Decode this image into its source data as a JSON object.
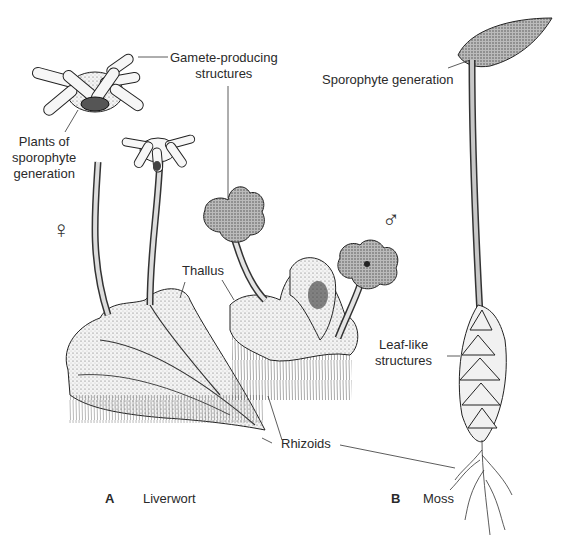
{
  "figure": {
    "panels": [
      {
        "letter": "A",
        "name": "Liverwort"
      },
      {
        "letter": "B",
        "name": "Moss"
      }
    ],
    "labels": {
      "gamete": [
        "Gamete-producing",
        "structures"
      ],
      "plants_sporophyte": [
        "Plants of",
        "sporophyte",
        "generation"
      ],
      "sporophyte_generation": "Sporophyte generation",
      "thallus": "Thallus",
      "leaf_like": [
        "Leaf-like",
        "structures"
      ],
      "rhizoids": "Rhizoids"
    },
    "symbols": {
      "female": "♀",
      "male": "♂"
    }
  }
}
